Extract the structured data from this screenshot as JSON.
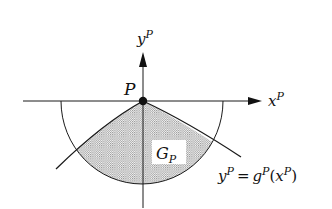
{
  "diagram": {
    "type": "geometric-figure",
    "labels": {
      "y_axis": {
        "base": "y",
        "sup": "P"
      },
      "x_axis": {
        "base": "x",
        "sup": "P"
      },
      "point": "P",
      "region": {
        "base": "G",
        "sub": "P"
      },
      "equation": {
        "lhs_base": "y",
        "lhs_sup": "P",
        "eq": "=",
        "fn_base": "g",
        "fn_sup": "P",
        "open": "(",
        "arg_base": "x",
        "arg_sup": "P",
        "close": ")"
      }
    },
    "colors": {
      "stroke": "#1a1a1a",
      "shade_dot": "#8a8a8a",
      "background": "#ffffff"
    }
  }
}
